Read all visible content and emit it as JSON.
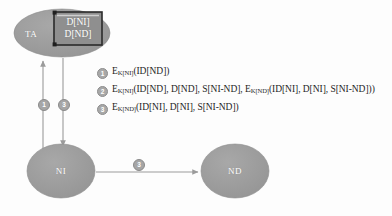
{
  "diagram": {
    "colors": {
      "node_fill": "#9a9a9a",
      "node_stroke": "#8c8c8c",
      "doc_fill": "#8f8f8f",
      "doc_border": "#2a2a2a",
      "arrow": "#9b9b9b",
      "marker_fill": "#a6a6a6",
      "text": "#1d1d1d",
      "background": "#fdfdfd"
    },
    "nodes": [
      {
        "id": "ta",
        "label": "TA",
        "shape": "ellipse"
      },
      {
        "id": "ni",
        "label": "NI",
        "shape": "circle"
      },
      {
        "id": "nd",
        "label": "ND",
        "shape": "circle"
      }
    ],
    "document": {
      "line1": "D[NI]",
      "line2": "D[ND]"
    },
    "arrows": [
      {
        "id": "ni-to-ta",
        "marker": "1",
        "from": "NI",
        "to": "TA"
      },
      {
        "id": "ta-to-ni",
        "marker": "3",
        "from": "TA",
        "to": "NI"
      },
      {
        "id": "ni-to-nd",
        "marker": "3",
        "from": "NI",
        "to": "ND"
      }
    ],
    "legend": [
      {
        "number": "1",
        "prefix": "E",
        "subscript": "K[NI]",
        "body": "(ID[ND])"
      },
      {
        "number": "2",
        "prefix": "E",
        "subscript": "K[NI]",
        "body": "(ID[ND], D[ND], S[NI-ND], E",
        "subscript2": "K[ND]",
        "body2": "(ID[NI], D[NI], S[NI-ND]))"
      },
      {
        "number": "3",
        "prefix": "E",
        "subscript": "K[ND]",
        "body": "(ID[NI], D[NI], S[NI-ND])"
      }
    ]
  }
}
